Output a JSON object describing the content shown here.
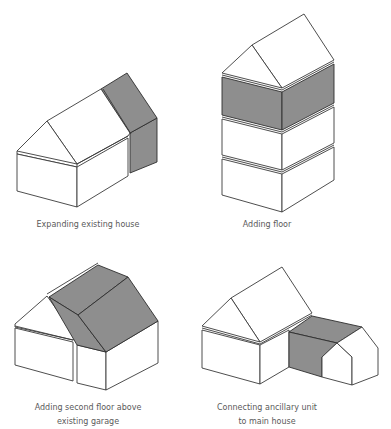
{
  "figure": {
    "panels": [
      {
        "id": "expanding",
        "caption_lines": [
          "Expanding existing house"
        ],
        "highlight": "gable-end extension"
      },
      {
        "id": "adding-floor",
        "caption_lines": [
          "Adding floor"
        ],
        "highlight": "inserted middle storey"
      },
      {
        "id": "garage-floor",
        "caption_lines": [
          "Adding second floor above",
          "existing garage"
        ],
        "highlight": "roof over garage"
      },
      {
        "id": "ancillary",
        "caption_lines": [
          "Connecting ancillary unit",
          "to main house"
        ],
        "highlight": "connecting link"
      }
    ],
    "colors": {
      "highlight": "#8e8e8e",
      "outline": "#3a3a3a",
      "background": "#ffffff",
      "caption": "#5a5a5a"
    }
  }
}
